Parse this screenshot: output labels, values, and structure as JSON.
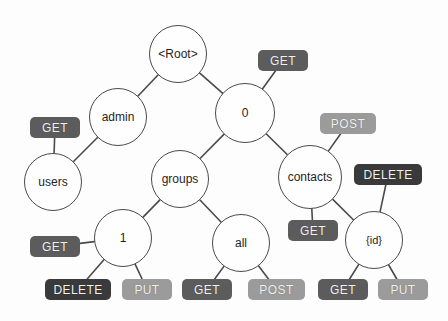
{
  "diagram": {
    "colors": {
      "node_fill": "#fefefe",
      "node_stroke": "#4a4a4a",
      "edge_stroke": "#4a4a4a",
      "badge_get": "#5c5c5c",
      "badge_post": "#9b9b9b",
      "badge_put": "#9b9b9b",
      "badge_delete": "#3a3a3a",
      "badge_text": "#f2f2f2",
      "background": "#fdfdfd"
    },
    "nodes": [
      {
        "id": "root",
        "label": "<Root>",
        "cx": 178,
        "cy": 54,
        "r": 29,
        "font": 12
      },
      {
        "id": "admin",
        "label": "admin",
        "cx": 118,
        "cy": 117,
        "r": 29,
        "font": 12
      },
      {
        "id": "zero",
        "label": "0",
        "cx": 245,
        "cy": 113,
        "r": 30,
        "font": 12
      },
      {
        "id": "users",
        "label": "users",
        "cx": 53,
        "cy": 182,
        "r": 29,
        "font": 12
      },
      {
        "id": "groups",
        "label": "groups",
        "cx": 180,
        "cy": 179,
        "r": 29,
        "font": 12
      },
      {
        "id": "contacts",
        "label": "contacts",
        "cx": 310,
        "cy": 177,
        "r": 32,
        "font": 12
      },
      {
        "id": "one",
        "label": "1",
        "cx": 123,
        "cy": 238,
        "r": 29,
        "font": 12
      },
      {
        "id": "all",
        "label": "all",
        "cx": 241,
        "cy": 243,
        "r": 29,
        "font": 12
      },
      {
        "id": "idparam",
        "label": "{id}",
        "cx": 374,
        "cy": 240,
        "r": 29,
        "font": 11
      }
    ],
    "badges": [
      {
        "id": "get-zero",
        "label": "GET",
        "method": "GET",
        "x": 258,
        "y": 50,
        "w": 50,
        "h": 21,
        "font": 12
      },
      {
        "id": "get-users",
        "label": "GET",
        "method": "GET",
        "x": 30,
        "y": 117,
        "w": 50,
        "h": 21,
        "font": 12
      },
      {
        "id": "post-contacts",
        "label": "POST",
        "method": "POST",
        "x": 320,
        "y": 113,
        "w": 56,
        "h": 21,
        "font": 12
      },
      {
        "id": "delete-id",
        "label": "DELETE",
        "method": "DELETE",
        "x": 354,
        "y": 164,
        "w": 68,
        "h": 21,
        "font": 12
      },
      {
        "id": "get-contacts",
        "label": "GET",
        "method": "GET",
        "x": 288,
        "y": 220,
        "w": 50,
        "h": 21,
        "font": 12
      },
      {
        "id": "get-one",
        "label": "GET",
        "method": "GET",
        "x": 30,
        "y": 236,
        "w": 50,
        "h": 21,
        "font": 12
      },
      {
        "id": "delete-one",
        "label": "DELETE",
        "method": "DELETE",
        "x": 45,
        "y": 279,
        "w": 66,
        "h": 21,
        "font": 12
      },
      {
        "id": "put-one",
        "label": "PUT",
        "method": "PUT",
        "x": 122,
        "y": 279,
        "w": 50,
        "h": 21,
        "font": 12
      },
      {
        "id": "get-all",
        "label": "GET",
        "method": "GET",
        "x": 182,
        "y": 279,
        "w": 50,
        "h": 21,
        "font": 12
      },
      {
        "id": "post-all",
        "label": "POST",
        "method": "POST",
        "x": 248,
        "y": 279,
        "w": 57,
        "h": 21,
        "font": 12
      },
      {
        "id": "get-id",
        "label": "GET",
        "method": "GET",
        "x": 318,
        "y": 279,
        "w": 50,
        "h": 21,
        "font": 12
      },
      {
        "id": "put-id",
        "label": "PUT",
        "method": "PUT",
        "x": 378,
        "y": 279,
        "w": 50,
        "h": 21,
        "font": 12
      }
    ],
    "edges": [
      {
        "id": "root-admin",
        "from": "root",
        "to": "admin",
        "fromType": "node",
        "toType": "node"
      },
      {
        "id": "root-zero",
        "from": "root",
        "to": "zero",
        "fromType": "node",
        "toType": "node"
      },
      {
        "id": "admin-users",
        "from": "admin",
        "to": "users",
        "fromType": "node",
        "toType": "node"
      },
      {
        "id": "zero-groups",
        "from": "zero",
        "to": "groups",
        "fromType": "node",
        "toType": "node"
      },
      {
        "id": "zero-contacts",
        "from": "zero",
        "to": "contacts",
        "fromType": "node",
        "toType": "node"
      },
      {
        "id": "zero-get",
        "from": "zero",
        "to": "get-zero",
        "fromType": "node",
        "toType": "badge"
      },
      {
        "id": "users-get",
        "from": "users",
        "to": "get-users",
        "fromType": "node",
        "toType": "badge"
      },
      {
        "id": "groups-one",
        "from": "groups",
        "to": "one",
        "fromType": "node",
        "toType": "node"
      },
      {
        "id": "groups-all",
        "from": "groups",
        "to": "all",
        "fromType": "node",
        "toType": "node"
      },
      {
        "id": "contacts-post",
        "from": "contacts",
        "to": "post-contacts",
        "fromType": "node",
        "toType": "badge"
      },
      {
        "id": "contacts-get",
        "from": "contacts",
        "to": "get-contacts",
        "fromType": "node",
        "toType": "badge"
      },
      {
        "id": "contacts-id",
        "from": "contacts",
        "to": "idparam",
        "fromType": "node",
        "toType": "node"
      },
      {
        "id": "id-delete",
        "from": "idparam",
        "to": "delete-id",
        "fromType": "node",
        "toType": "badge"
      },
      {
        "id": "one-get",
        "from": "one",
        "to": "get-one",
        "fromType": "node",
        "toType": "badge"
      },
      {
        "id": "one-delete",
        "from": "one",
        "to": "delete-one",
        "fromType": "node",
        "toType": "badge"
      },
      {
        "id": "one-put",
        "from": "one",
        "to": "put-one",
        "fromType": "node",
        "toType": "badge"
      },
      {
        "id": "all-get",
        "from": "all",
        "to": "get-all",
        "fromType": "node",
        "toType": "badge"
      },
      {
        "id": "all-post",
        "from": "all",
        "to": "post-all",
        "fromType": "node",
        "toType": "badge"
      },
      {
        "id": "id-get",
        "from": "idparam",
        "to": "get-id",
        "fromType": "node",
        "toType": "badge"
      },
      {
        "id": "id-put",
        "from": "idparam",
        "to": "put-id",
        "fromType": "node",
        "toType": "badge"
      }
    ]
  }
}
